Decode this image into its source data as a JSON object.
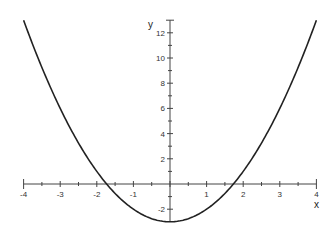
{
  "chart_data": {
    "type": "line",
    "title": "",
    "xlabel": "x",
    "ylabel": "y",
    "function": "y = x^2 - 3",
    "xlim": [
      -4,
      4
    ],
    "ylim": [
      -3,
      13
    ],
    "grid": false,
    "legend": null,
    "x_ticks": [
      -4,
      -3,
      -2,
      -1,
      1,
      2,
      3,
      4
    ],
    "x_minor_step": 0.5,
    "y_ticks": [
      -2,
      2,
      4,
      6,
      8,
      10,
      12
    ],
    "y_minor_step": 1,
    "series": [
      {
        "name": "y = x^2 - 3",
        "x": [
          -4,
          -3.5,
          -3,
          -2.5,
          -2,
          -1.5,
          -1,
          -0.5,
          0,
          0.5,
          1,
          1.5,
          2,
          2.5,
          3,
          3.5,
          4
        ],
        "y": [
          13,
          9.25,
          6,
          3.25,
          1,
          -0.75,
          -2,
          -2.75,
          -3,
          -2.75,
          -2,
          -0.75,
          1,
          3.25,
          6,
          9.25,
          13
        ]
      }
    ],
    "color": "#222222"
  }
}
